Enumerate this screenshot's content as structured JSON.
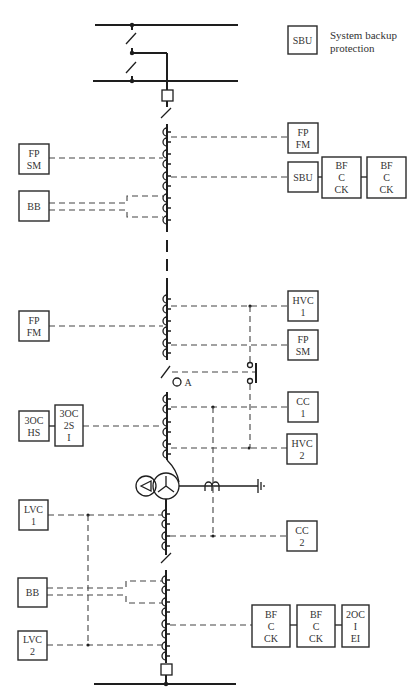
{
  "legend": {
    "box_label": "SBU",
    "description_line1": "System backup",
    "description_line2": "protection"
  },
  "busbars": [
    {
      "id": "busbar-top-1",
      "x1": 95,
      "x2": 238,
      "y": 25
    },
    {
      "id": "busbar-top-2",
      "x1": 93,
      "x2": 238,
      "y": 81
    },
    {
      "id": "busbar-bottom",
      "x1": 94,
      "x2": 236,
      "y": 684
    }
  ],
  "relays": [
    {
      "id": "fp-sm-1",
      "lines": [
        "FP",
        "SM"
      ],
      "x": 19,
      "y": 144,
      "w": 30,
      "h": 30
    },
    {
      "id": "bb-1",
      "lines": [
        "BB"
      ],
      "x": 19,
      "y": 191,
      "w": 30,
      "h": 30
    },
    {
      "id": "fp-fm-1",
      "lines": [
        "FP",
        "FM"
      ],
      "x": 288,
      "y": 123,
      "w": 30,
      "h": 30
    },
    {
      "id": "sbu-1",
      "lines": [
        "SBU"
      ],
      "x": 288,
      "y": 162,
      "w": 30,
      "h": 30
    },
    {
      "id": "bf-c-ck-1",
      "lines": [
        "BF",
        "C",
        "CK"
      ],
      "x": 322,
      "y": 157,
      "w": 39,
      "h": 41
    },
    {
      "id": "bf-c-ck-2",
      "lines": [
        "BF",
        "C",
        "CK"
      ],
      "x": 367,
      "y": 157,
      "w": 39,
      "h": 41
    },
    {
      "id": "fp-fm-2",
      "lines": [
        "FP",
        "FM"
      ],
      "x": 19,
      "y": 311,
      "w": 30,
      "h": 30
    },
    {
      "id": "hvc-1",
      "lines": [
        "HVC",
        "1"
      ],
      "x": 288,
      "y": 291,
      "w": 30,
      "h": 30
    },
    {
      "id": "fp-sm-2",
      "lines": [
        "FP",
        "SM"
      ],
      "x": 288,
      "y": 330,
      "w": 30,
      "h": 30
    },
    {
      "id": "cc-1",
      "lines": [
        "CC",
        "1"
      ],
      "x": 288,
      "y": 392,
      "w": 30,
      "h": 30
    },
    {
      "id": "3oc-hs",
      "lines": [
        "3OC",
        "HS"
      ],
      "x": 19,
      "y": 411,
      "w": 30,
      "h": 30
    },
    {
      "id": "3oc-2s-i",
      "lines": [
        "3OC",
        "2S",
        "I"
      ],
      "x": 55,
      "y": 405,
      "w": 28,
      "h": 41
    },
    {
      "id": "hvc-2",
      "lines": [
        "HVC",
        "2"
      ],
      "x": 287,
      "y": 434,
      "w": 30,
      "h": 30
    },
    {
      "id": "lvc-1",
      "lines": [
        "LVC",
        "1"
      ],
      "x": 19,
      "y": 500,
      "w": 29,
      "h": 30
    },
    {
      "id": "cc-2",
      "lines": [
        "CC",
        "2"
      ],
      "x": 287,
      "y": 521,
      "w": 30,
      "h": 30
    },
    {
      "id": "bb-2",
      "lines": [
        "BB"
      ],
      "x": 18,
      "y": 578,
      "w": 29,
      "h": 29
    },
    {
      "id": "lvc-2",
      "lines": [
        "LVC",
        "2"
      ],
      "x": 18,
      "y": 631,
      "w": 29,
      "h": 29
    },
    {
      "id": "bf-c-ck-3",
      "lines": [
        "BF",
        "C",
        "CK"
      ],
      "x": 252,
      "y": 605,
      "w": 38,
      "h": 42
    },
    {
      "id": "bf-c-ck-4",
      "lines": [
        "BF",
        "C",
        "CK"
      ],
      "x": 297,
      "y": 605,
      "w": 38,
      "h": 42
    },
    {
      "id": "2oc-i-ei",
      "lines": [
        "2OC",
        "I",
        "EI"
      ],
      "x": 342,
      "y": 605,
      "w": 27,
      "h": 42
    }
  ],
  "annotations": {
    "switch_label": "A"
  }
}
